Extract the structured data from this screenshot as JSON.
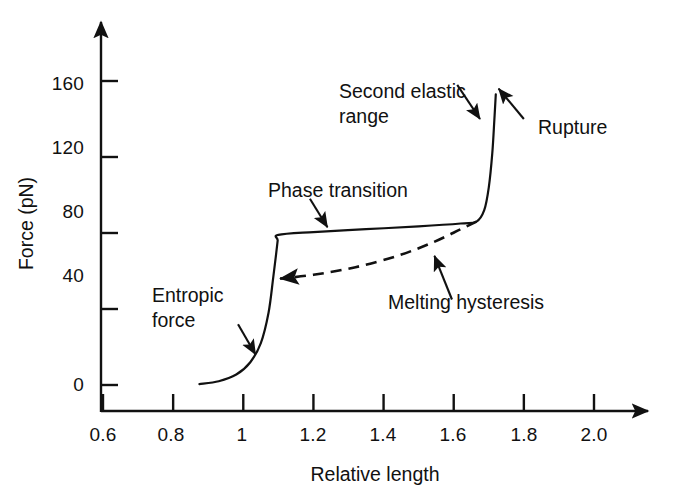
{
  "chart_data": {
    "type": "line",
    "title": "",
    "xlabel": "Relative length",
    "ylabel": "Force (pN)",
    "xlim": [
      0.5,
      2.1
    ],
    "ylim": [
      0,
      190
    ],
    "grid": false,
    "legend": "none",
    "xticks": [
      "0.6",
      "0.8",
      "1",
      "1.2",
      "1.4",
      "1.6",
      "1.8",
      "2.0"
    ],
    "xtick_values": [
      0.6,
      0.8,
      1.0,
      1.2,
      1.4,
      1.6,
      1.8,
      2.0
    ],
    "yticks": [
      "0",
      "40",
      "80",
      "120",
      "160"
    ],
    "ytick_values": [
      0,
      40,
      80,
      120,
      160
    ],
    "series": [
      {
        "name": "Stretching curve",
        "style": "solid",
        "points": [
          [
            0.875,
            0.5
          ],
          [
            0.93,
            2.0
          ],
          [
            0.98,
            5.5
          ],
          [
            1.02,
            12.0
          ],
          [
            1.05,
            22.0
          ],
          [
            1.072,
            38.0
          ],
          [
            1.085,
            56.0
          ],
          [
            1.093,
            68.0
          ],
          [
            1.098,
            76.0
          ],
          [
            1.1,
            79.0
          ],
          [
            1.2,
            80.5
          ],
          [
            1.35,
            82.0
          ],
          [
            1.5,
            83.5
          ],
          [
            1.62,
            85.0
          ],
          [
            1.665,
            86.0
          ],
          [
            1.687,
            92.0
          ],
          [
            1.7,
            104.0
          ],
          [
            1.71,
            122.0
          ],
          [
            1.716,
            140.0
          ],
          [
            1.72,
            153.0
          ]
        ]
      },
      {
        "name": "Relaxation (melting hysteresis) curve",
        "style": "dashed",
        "points": [
          [
            1.105,
            56.0
          ],
          [
            1.2,
            58.0
          ],
          [
            1.32,
            62.0
          ],
          [
            1.44,
            68.0
          ],
          [
            1.54,
            75.0
          ],
          [
            1.62,
            82.0
          ],
          [
            1.665,
            86.0
          ]
        ]
      }
    ],
    "annotations": [
      {
        "id": "entropic-force",
        "text": "Entropic\nforce",
        "lines": [
          "Entropic",
          "force"
        ],
        "arrow_from": [
          0.985,
          32
        ],
        "arrow_to": [
          1.035,
          16
        ]
      },
      {
        "id": "phase-transition",
        "text": "Phase transition",
        "lines": [
          "Phase transition"
        ],
        "arrow_from": [
          1.19,
          98
        ],
        "arrow_to": [
          1.24,
          83
        ]
      },
      {
        "id": "second-elastic-range",
        "text": "Second elastic\nrange",
        "lines": [
          "Second elastic",
          "range"
        ],
        "arrow_from": [
          1.61,
          158
        ],
        "arrow_to": [
          1.675,
          140
        ]
      },
      {
        "id": "rupture",
        "text": "Rupture",
        "lines": [
          "Rupture"
        ],
        "arrow_from": [
          1.8,
          140
        ],
        "arrow_to": [
          1.728,
          156
        ]
      },
      {
        "id": "melting-hysteresis",
        "text": "Melting hysteresis",
        "lines": [
          "Melting hysteresis"
        ],
        "arrow_from": [
          1.595,
          45
        ],
        "arrow_to": [
          1.545,
          68
        ]
      }
    ]
  },
  "axes": {
    "x_axis_label": "Relative length",
    "y_axis_label": "Force (pN)"
  },
  "colors": {
    "curve": "#111111",
    "axis": "#111111",
    "background": "#ffffff"
  }
}
